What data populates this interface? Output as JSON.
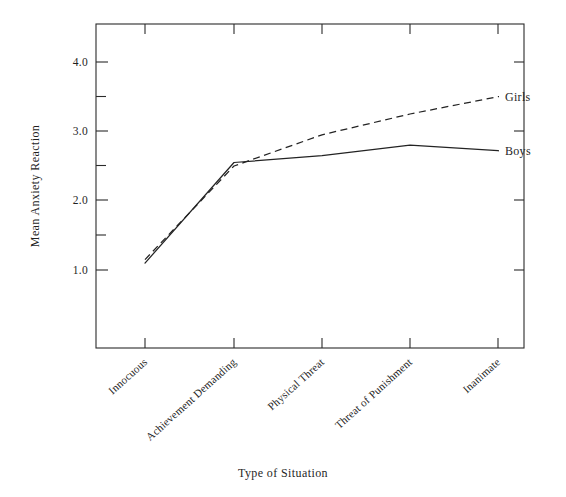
{
  "chart_data": {
    "type": "line",
    "title": "",
    "xlabel": "Type of Situation",
    "ylabel": "Mean Anxiety Reaction",
    "categories": [
      "Innocuous",
      "Achievement Demanding",
      "Physical Threat",
      "Threat of Punishment",
      "Inanimate"
    ],
    "series": [
      {
        "name": "Boys",
        "style": "solid",
        "values": [
          1.1,
          2.55,
          2.65,
          2.8,
          2.72
        ]
      },
      {
        "name": "Girls",
        "style": "dashed",
        "values": [
          1.15,
          2.5,
          2.95,
          3.25,
          3.5
        ]
      }
    ],
    "ylim": [
      0.5,
      4.5
    ],
    "ytick_labels": [
      "4.0",
      "3.0",
      "2.0",
      "1.0"
    ],
    "ytick_values": [
      4.0,
      3.0,
      2.0,
      1.0
    ],
    "yminor_values": [
      3.5,
      2.5,
      1.5
    ],
    "grid": false,
    "legend_position": "inline-right",
    "line_color": "#232323",
    "axis_color": "#2b2b2b"
  },
  "axes": {
    "y_title": "Mean Anxiety Reaction",
    "x_title": "Type of Situation"
  },
  "labels": {
    "y_4": "4.0",
    "y_3": "3.0",
    "y_2": "2.0",
    "y_1": "1.0",
    "x_0": "Innocuous",
    "x_1": "Achievement Demanding",
    "x_2": "Physical Threat",
    "x_3": "Threat of Punishment",
    "x_4": "Inanimate",
    "series_boys": "Boys",
    "series_girls": "Girls"
  }
}
